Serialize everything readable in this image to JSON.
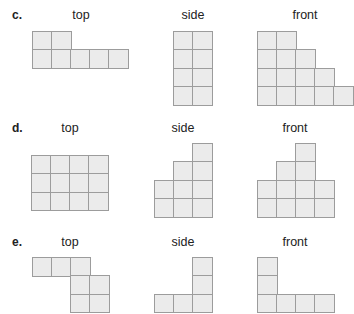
{
  "colors": {
    "cell_fill": "#ebebeb",
    "cell_border": "#9c9c9c",
    "text": "#222222"
  },
  "problems": [
    {
      "letter": "c.",
      "views": [
        {
          "label": "top",
          "cols": 5,
          "rows": 2,
          "cells": [
            [
              1,
              1,
              0,
              0,
              0
            ],
            [
              1,
              1,
              1,
              1,
              1
            ]
          ]
        },
        {
          "label": "side",
          "cols": 2,
          "rows": 4,
          "cells": [
            [
              1,
              1
            ],
            [
              1,
              1
            ],
            [
              1,
              1
            ],
            [
              1,
              1
            ]
          ]
        },
        {
          "label": "front",
          "cols": 5,
          "rows": 4,
          "cells": [
            [
              1,
              1,
              0,
              0,
              0
            ],
            [
              1,
              1,
              1,
              0,
              0
            ],
            [
              1,
              1,
              1,
              1,
              0
            ],
            [
              1,
              1,
              1,
              1,
              1
            ]
          ]
        }
      ]
    },
    {
      "letter": "d.",
      "views": [
        {
          "label": "top",
          "cols": 4,
          "rows": 3,
          "cells": [
            [
              1,
              1,
              1,
              1
            ],
            [
              1,
              1,
              1,
              1
            ],
            [
              1,
              1,
              1,
              1
            ]
          ]
        },
        {
          "label": "side",
          "cols": 3,
          "rows": 4,
          "cells": [
            [
              0,
              0,
              1
            ],
            [
              0,
              1,
              1
            ],
            [
              1,
              1,
              1
            ],
            [
              1,
              1,
              1
            ]
          ]
        },
        {
          "label": "front",
          "cols": 4,
          "rows": 4,
          "cells": [
            [
              0,
              0,
              1,
              0
            ],
            [
              0,
              1,
              1,
              0
            ],
            [
              1,
              1,
              1,
              1
            ],
            [
              1,
              1,
              1,
              1
            ]
          ]
        }
      ]
    },
    {
      "letter": "e.",
      "views": [
        {
          "label": "top",
          "cols": 4,
          "rows": 3,
          "cells": [
            [
              1,
              1,
              1,
              0
            ],
            [
              0,
              0,
              1,
              1
            ],
            [
              0,
              0,
              1,
              1
            ]
          ]
        },
        {
          "label": "side",
          "cols": 3,
          "rows": 3,
          "cells": [
            [
              0,
              0,
              1
            ],
            [
              0,
              0,
              1
            ],
            [
              1,
              1,
              1
            ]
          ]
        },
        {
          "label": "front",
          "cols": 4,
          "rows": 3,
          "cells": [
            [
              1,
              0,
              0,
              0
            ],
            [
              1,
              0,
              0,
              0
            ],
            [
              1,
              1,
              1,
              1
            ]
          ]
        }
      ]
    }
  ]
}
